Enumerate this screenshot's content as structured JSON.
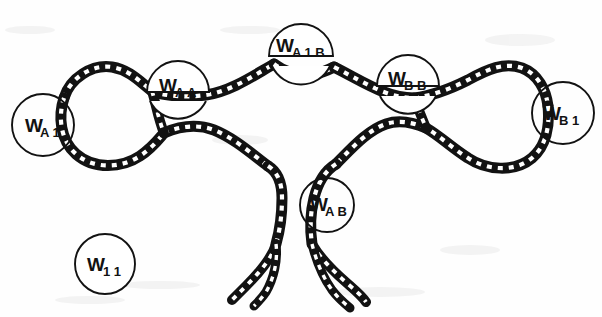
{
  "figure": {
    "kind": "line-art-chain-diagram",
    "title": "",
    "background_color": "#fefefe",
    "ink_color": "#121212",
    "width": 602,
    "height": 317
  },
  "nodes": [
    {
      "id": "w-a1",
      "main": "W",
      "sub": "A 1",
      "cx": 43,
      "cy": 125,
      "r": 31,
      "opaque": false,
      "role": "left-terminal-label"
    },
    {
      "id": "w-aa",
      "main": "W",
      "sub": "A A",
      "cx": 178,
      "cy": 92,
      "r": 31,
      "opaque": true,
      "role": "left-junction-label"
    },
    {
      "id": "w-a1b",
      "main": "W",
      "sub": "A 1 B",
      "cx": 301,
      "cy": 50,
      "r": 32,
      "opaque": true,
      "role": "top-apex-label"
    },
    {
      "id": "w-bb",
      "main": "W",
      "sub": "B B",
      "cx": 408,
      "cy": 85,
      "r": 31,
      "opaque": true,
      "role": "right-junction-label"
    },
    {
      "id": "w-b1",
      "main": "W",
      "sub": "B 1",
      "cx": 563,
      "cy": 113,
      "r": 31,
      "opaque": false,
      "role": "right-terminal-label"
    },
    {
      "id": "w-ab",
      "main": "W",
      "sub": "A B",
      "cx": 327,
      "cy": 205,
      "r": 27,
      "opaque": false,
      "role": "lower-strand-label"
    },
    {
      "id": "w-11",
      "main": "W",
      "sub": "1 1",
      "cx": 105,
      "cy": 264,
      "r": 30,
      "opaque": false,
      "role": "free-standing-label"
    }
  ],
  "chain_segments": [
    {
      "id": "left-loop",
      "name": "left-outer-loop"
    },
    {
      "id": "upper-left-arc",
      "name": "upper-left-arc-to-apex"
    },
    {
      "id": "upper-right-arc",
      "name": "upper-right-arc-from-apex"
    },
    {
      "id": "right-loop",
      "name": "right-outer-loop"
    },
    {
      "id": "lower-left-arc",
      "name": "lower-left-arc"
    },
    {
      "id": "lower-right-arc",
      "name": "lower-right-arc"
    },
    {
      "id": "descender-left",
      "name": "left-descending-strand"
    },
    {
      "id": "descender-right",
      "name": "right-descending-strand"
    }
  ]
}
